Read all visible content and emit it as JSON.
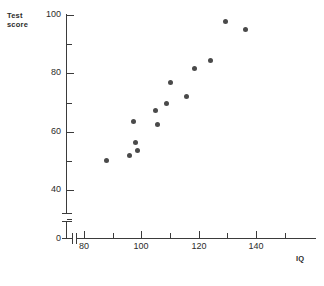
{
  "chart_data": {
    "type": "scatter",
    "title": "",
    "xlabel": "IQ",
    "ylabel": "Test score",
    "ylabel_lines": [
      "Test",
      "score"
    ],
    "xlim": [
      72,
      158
    ],
    "ylim": [
      0,
      103
    ],
    "y_axis_break": true,
    "x_axis_break": true,
    "grid": false,
    "legend": null,
    "x_ticks_major": [
      80,
      100,
      120,
      140
    ],
    "x_ticks_minor": [
      90,
      110,
      130,
      150
    ],
    "x_tick_labels": [
      "80",
      "100",
      "120",
      "140"
    ],
    "y_ticks_major": [
      0,
      40,
      60,
      80,
      100
    ],
    "y_ticks_minor": [
      50,
      70,
      90
    ],
    "y_tick_labels": [
      "0",
      "40",
      "60",
      "80",
      "100"
    ],
    "marker": {
      "shape": "circle",
      "color": "#4a4a4a",
      "size_px": 5
    },
    "points": [
      {
        "x": 87.7,
        "y": 50.0
      },
      {
        "x": 95.7,
        "y": 52.0
      },
      {
        "x": 97.4,
        "y": 63.5
      },
      {
        "x": 98.1,
        "y": 56.3
      },
      {
        "x": 98.8,
        "y": 53.4
      },
      {
        "x": 105.1,
        "y": 67.4
      },
      {
        "x": 105.8,
        "y": 62.3
      },
      {
        "x": 108.9,
        "y": 69.8
      },
      {
        "x": 110.3,
        "y": 76.7
      },
      {
        "x": 115.6,
        "y": 71.9
      },
      {
        "x": 118.4,
        "y": 81.8
      },
      {
        "x": 124.3,
        "y": 84.5
      },
      {
        "x": 129.5,
        "y": 97.9
      },
      {
        "x": 136.5,
        "y": 95.2
      }
    ]
  },
  "colors": {
    "axis": "#3b3b3b",
    "marker": "#4a4a4a",
    "text": "#2b2b2b",
    "background": "#ffffff"
  }
}
